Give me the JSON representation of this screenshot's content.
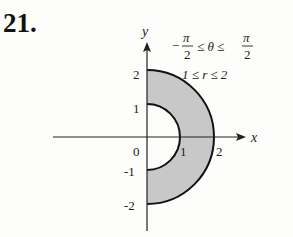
{
  "problem_number": "21.",
  "axes": {
    "x_label": "x",
    "y_label": "y",
    "origin_label": "0"
  },
  "ticks": {
    "x": [
      "1",
      "2"
    ],
    "y": [
      "2",
      "1",
      "-1",
      "-2"
    ]
  },
  "region": {
    "theta_lower": "−π/2",
    "theta_upper": "π/2",
    "r_lower": "1",
    "r_upper": "2",
    "fill_color": "#c8c8c8",
    "stroke_color": "#111111"
  },
  "annotations": {
    "theta_line": [
      "−",
      "π",
      "2",
      "≤ θ ≤",
      "π",
      "2"
    ],
    "r_line": "1 ≤ r ≤ 2"
  }
}
